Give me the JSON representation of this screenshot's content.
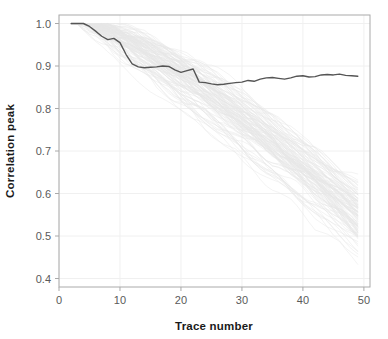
{
  "chart_data": {
    "type": "line",
    "title": "",
    "xlabel": "Trace number",
    "ylabel": "Correlation peak",
    "xlim": [
      0,
      51
    ],
    "ylim": [
      0.38,
      1.02
    ],
    "xticks": [
      0,
      10,
      20,
      30,
      40,
      50
    ],
    "xtick_labels": [
      "0",
      "10",
      "20",
      "30",
      "40",
      "50"
    ],
    "yticks": [
      0.4,
      0.5,
      0.6,
      0.7,
      0.8,
      0.9,
      1.0
    ],
    "ytick_labels": [
      "0.4",
      "0.5",
      "0.6",
      "0.7",
      "0.8",
      "0.9",
      "1.0"
    ],
    "grid": true,
    "legend": "none",
    "colors": {
      "highlight_line": "#555555",
      "background_traces": "#e6e6e6",
      "frame": "#aaaaaa",
      "gridline": "#f0f0f0",
      "tick_text": "#5a5a5a",
      "axis_title": "#1a1a1a",
      "plot_background": "#ffffff"
    },
    "series": [
      {
        "name": "highlight",
        "role": "foreground-reference-trace",
        "color": "#555555",
        "x": [
          2,
          3,
          4,
          5,
          6,
          7,
          8,
          9,
          10,
          11,
          12,
          13,
          14,
          15,
          16,
          17,
          18,
          19,
          20,
          21,
          22,
          23,
          24,
          25,
          26,
          27,
          28,
          29,
          30,
          31,
          32,
          33,
          34,
          35,
          36,
          37,
          38,
          39,
          40,
          41,
          42,
          43,
          44,
          45,
          46,
          47,
          48,
          49
        ],
        "y": [
          1.0,
          1.0,
          1.0,
          0.993,
          0.982,
          0.97,
          0.962,
          0.965,
          0.955,
          0.927,
          0.905,
          0.898,
          0.896,
          0.897,
          0.898,
          0.9,
          0.899,
          0.891,
          0.885,
          0.889,
          0.893,
          0.862,
          0.861,
          0.858,
          0.856,
          0.857,
          0.859,
          0.861,
          0.862,
          0.866,
          0.864,
          0.869,
          0.872,
          0.873,
          0.871,
          0.869,
          0.872,
          0.876,
          0.877,
          0.874,
          0.875,
          0.879,
          0.88,
          0.879,
          0.881,
          0.878,
          0.877,
          0.876
        ]
      },
      {
        "name": "trace_bundle",
        "role": "background-ensemble",
        "color": "#e6e6e6",
        "count": 110,
        "x_start": 2,
        "x_end": 49,
        "y_start": 1.0,
        "y_end_min": 0.41,
        "y_end_max": 0.68,
        "description": "Ensemble of ~110 individual correlation-peak decay traces, all starting near 1.0 at trace 2 and fanning downward; by trace 49 the bundle spans roughly 0.41 to 0.68."
      }
    ]
  },
  "axes": {
    "x_title": "Trace number",
    "y_title": "Correlation peak"
  }
}
